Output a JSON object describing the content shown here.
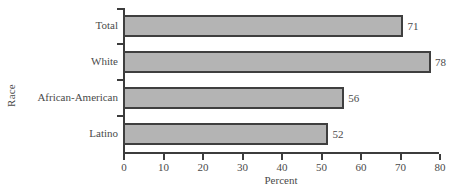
{
  "chart_data": {
    "type": "bar",
    "orientation": "horizontal",
    "title": "",
    "xlabel": "Percent",
    "ylabel": "Race",
    "categories": [
      "Total",
      "White",
      "African-American",
      "Latino"
    ],
    "values": [
      71,
      78,
      56,
      52
    ],
    "value_labels": [
      "71",
      "78",
      "56",
      "52"
    ],
    "xlim": [
      0,
      80
    ],
    "xticks": [
      0,
      10,
      20,
      30,
      40,
      50,
      60,
      70,
      80
    ],
    "xtick_labels": [
      "0",
      "10",
      "20",
      "30",
      "40",
      "50",
      "60",
      "70",
      "80"
    ],
    "grid": false,
    "legend": false,
    "bar_color": "#b4b4b4",
    "bar_edge_color": "#3f3f3f",
    "axis_color": "#3c3c3c",
    "text_color": "#4a4a4a"
  }
}
